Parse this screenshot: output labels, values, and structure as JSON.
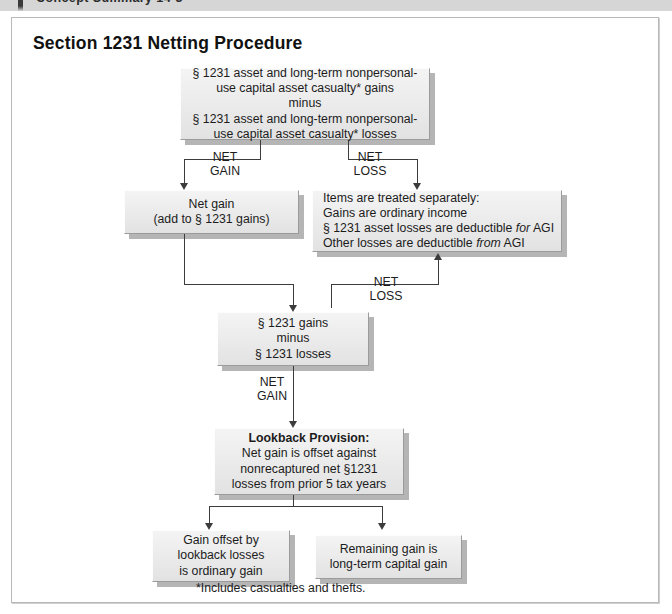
{
  "running_head": {
    "text": "Concept Summary 14-3"
  },
  "page": {
    "title": "Section 1231 Netting Procedure",
    "footnote": "*Includes casualties and thefts."
  },
  "boxes": {
    "top_netting": {
      "line1": "§ 1231 asset and long-term nonpersonal-",
      "line2": "use capital asset casualty* gains",
      "line3": "minus",
      "line4": "§ 1231 asset and long-term nonpersonal-",
      "line5": "use capital asset casualty* losses"
    },
    "net_gain": {
      "line1": "Net gain",
      "line2": "(add to § 1231 gains)"
    },
    "items_separately": {
      "line1": "Items are treated separately:",
      "line2": "Gains are ordinary income",
      "line3_a": "§ 1231 asset losses are deductible ",
      "line3_em": "for",
      "line3_b": " AGI",
      "line4_a": "Other losses are deductible ",
      "line4_em": "from",
      "line4_b": " AGI"
    },
    "gains_minus_losses": {
      "line1": "§ 1231 gains",
      "line2": "minus",
      "line3": "§ 1231 losses"
    },
    "lookback": {
      "heading": "Lookback Provision:",
      "line1": "Net gain is offset against",
      "line2": "nonrecaptured net §1231",
      "line3": "losses from prior 5 tax years"
    },
    "ordinary_gain": {
      "line1": "Gain offset by",
      "line2": "lookback losses",
      "line3": "is ordinary gain"
    },
    "capital_gain": {
      "line1": "Remaining gain is",
      "line2": "long-term capital gain"
    }
  },
  "edge_labels": {
    "net_gain_1": {
      "line1": "NET",
      "line2": "GAIN"
    },
    "net_loss_1": {
      "line1": "NET",
      "line2": "LOSS"
    },
    "net_loss_2": {
      "line1": "NET",
      "line2": "LOSS"
    },
    "net_gain_2": {
      "line1": "NET",
      "line2": "GAIN"
    }
  },
  "colors": {
    "box_face": "#ececec",
    "box_shadow": "#b5b5b5",
    "connector": "#3c3c3c",
    "band": "#d6d6d6"
  }
}
